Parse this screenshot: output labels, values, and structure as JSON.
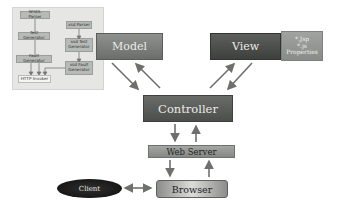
{
  "diagram": {
    "type": "MVC architecture",
    "inset": {
      "left_column": [
        "WSDL Parser",
        "Test Generator",
        "Fault Generator",
        "HTTP Invoker"
      ],
      "right_column": [
        "xsd Parser",
        "xsd Test Generator",
        "xsd Fault Generator"
      ]
    },
    "nodes": {
      "model": "Model",
      "view": "View",
      "view_files": [
        "*.Jsp",
        "*.js",
        "Properties"
      ],
      "controller": "Controller",
      "web_server": "Web Server",
      "browser": "Browser",
      "client": "Client"
    },
    "edges": [
      {
        "from": "Model",
        "to": "Controller",
        "direction": "both"
      },
      {
        "from": "View",
        "to": "Controller",
        "direction": "both"
      },
      {
        "from": "Controller",
        "to": "Web Server",
        "direction": "both"
      },
      {
        "from": "Web Server",
        "to": "Browser",
        "direction": "both"
      },
      {
        "from": "Client",
        "to": "Browser",
        "direction": "bidirectional"
      }
    ],
    "colors": {
      "model": "#7c7f7b",
      "view": "#4e504d",
      "controller": "#5b5d5a",
      "web_server": "#959894",
      "client": "#1a1a1a",
      "arrow": "#6e706d"
    }
  }
}
